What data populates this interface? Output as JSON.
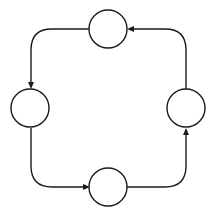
{
  "diagram": {
    "type": "cycle",
    "direction": "counter-clockwise",
    "colors": {
      "stroke": "#1a1a1a",
      "node_fill": "#ffffff",
      "background": "#ffffff"
    },
    "nodes": [
      {
        "id": "top",
        "label": ""
      },
      {
        "id": "left",
        "label": ""
      },
      {
        "id": "bottom",
        "label": ""
      },
      {
        "id": "right",
        "label": ""
      }
    ],
    "edges": [
      {
        "from": "top",
        "to": "left"
      },
      {
        "from": "left",
        "to": "bottom"
      },
      {
        "from": "bottom",
        "to": "right"
      },
      {
        "from": "right",
        "to": "top"
      }
    ]
  }
}
